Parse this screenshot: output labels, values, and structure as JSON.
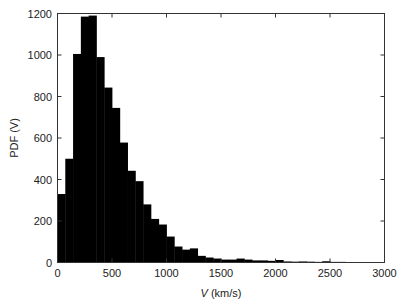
{
  "chart_data": {
    "type": "bar",
    "title": "",
    "xlabel": "V (km/s)",
    "xlabel_italic": "V",
    "xlabel_unit": " (km/s)",
    "ylabel": "PDF (V)",
    "xlim": [
      0,
      3000
    ],
    "ylim": [
      0,
      1200
    ],
    "grid": false,
    "legend": null,
    "bar_color": "#000000",
    "bin_width": 71.43,
    "x_ticks": [
      0,
      500,
      1000,
      1500,
      2000,
      2500,
      3000
    ],
    "y_ticks": [
      0,
      200,
      400,
      600,
      800,
      1000,
      1200
    ],
    "bin_edges_start": [
      0,
      71,
      143,
      214,
      286,
      357,
      429,
      500,
      571,
      643,
      714,
      786,
      857,
      929,
      1000,
      1071,
      1143,
      1214,
      1286,
      1357,
      1429,
      1500,
      1571,
      1643,
      1714,
      1786,
      1857,
      1929,
      2000,
      2071,
      2143,
      2214,
      2286,
      2357,
      2429,
      2500,
      2571,
      2643,
      2714,
      2786,
      2857,
      2929
    ],
    "values": [
      330,
      500,
      1005,
      1185,
      1190,
      990,
      843,
      745,
      578,
      442,
      392,
      280,
      210,
      183,
      125,
      77,
      62,
      68,
      32,
      24,
      19,
      14,
      14,
      19,
      14,
      10,
      10,
      8,
      12,
      5,
      4,
      5,
      4,
      3,
      6,
      3,
      3,
      2,
      2,
      1,
      2,
      1
    ]
  }
}
